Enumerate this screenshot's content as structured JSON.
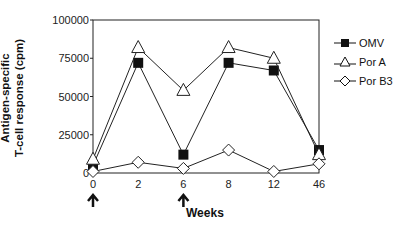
{
  "chart_data": {
    "type": "line",
    "title": "",
    "xlabel": "Weeks",
    "ylabel": "Antigen-specific T-cell response (cpm)",
    "ylabel_lines": [
      "Antigen-specific",
      "T-cell response (cpm)"
    ],
    "categories": [
      "0",
      "2",
      "6",
      "8",
      "12",
      "46"
    ],
    "yticks": [
      "0",
      "25000",
      "50000",
      "75000",
      "100000"
    ],
    "ylim": [
      0,
      100000
    ],
    "grid": false,
    "legend_position": "right",
    "series": [
      {
        "name": "OMV",
        "marker": "filled-square",
        "values": [
          5000,
          72000,
          12000,
          72000,
          67000,
          15000
        ]
      },
      {
        "name": "Por A",
        "marker": "open-triangle",
        "values": [
          9000,
          82000,
          54000,
          82000,
          75000,
          12000
        ]
      },
      {
        "name": "Por B3",
        "marker": "open-diamond",
        "values": [
          1000,
          7000,
          3000,
          15000,
          1000,
          6000
        ]
      }
    ],
    "annotations": [
      {
        "type": "arrow-up",
        "at": "0"
      },
      {
        "type": "arrow-up",
        "at": "6"
      }
    ]
  }
}
